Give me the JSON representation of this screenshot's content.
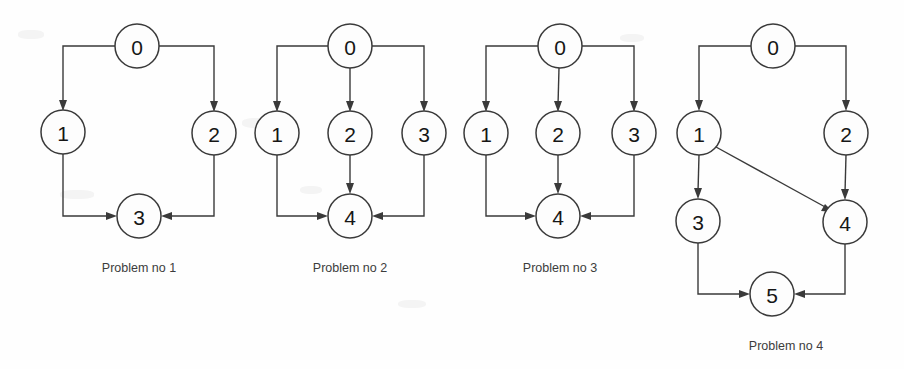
{
  "figure": {
    "width": 904,
    "height": 369,
    "background_color": "#fefefe",
    "stroke_color": "#3a3a3a",
    "label_color": "#161616",
    "caption_color": "#3c3c3c",
    "node_radius": 22
  },
  "diagrams": [
    {
      "id": "problem-1",
      "caption": "Problem no 1",
      "caption_x": 139,
      "caption_y": 272,
      "nodes": [
        {
          "label": "0",
          "x": 137,
          "y": 46
        },
        {
          "label": "1",
          "x": 63,
          "y": 132
        },
        {
          "label": "2",
          "x": 214,
          "y": 133
        },
        {
          "label": "3",
          "x": 139,
          "y": 216
        }
      ],
      "edges": [
        {
          "from": "0",
          "to": "1",
          "shape": "elbow-left-down"
        },
        {
          "from": "0",
          "to": "2",
          "shape": "elbow-right-down"
        },
        {
          "from": "1",
          "to": "3",
          "shape": "elbow-down-right"
        },
        {
          "from": "2",
          "to": "3",
          "shape": "elbow-down-left"
        }
      ]
    },
    {
      "id": "problem-2",
      "caption": "Problem no 2",
      "caption_x": 350,
      "caption_y": 272,
      "nodes": [
        {
          "label": "0",
          "x": 350,
          "y": 46
        },
        {
          "label": "1",
          "x": 277,
          "y": 133
        },
        {
          "label": "2",
          "x": 350,
          "y": 133
        },
        {
          "label": "3",
          "x": 424,
          "y": 133
        },
        {
          "label": "4",
          "x": 350,
          "y": 216
        }
      ],
      "edges": [
        {
          "from": "0",
          "to": "1",
          "shape": "elbow-left-down"
        },
        {
          "from": "0",
          "to": "2",
          "shape": "straight-down"
        },
        {
          "from": "0",
          "to": "3",
          "shape": "elbow-right-down"
        },
        {
          "from": "1",
          "to": "4",
          "shape": "elbow-down-right"
        },
        {
          "from": "2",
          "to": "4",
          "shape": "straight-down"
        },
        {
          "from": "3",
          "to": "4",
          "shape": "elbow-down-left"
        }
      ]
    },
    {
      "id": "problem-3",
      "caption": "Problem no 3",
      "caption_x": 560,
      "caption_y": 272,
      "nodes": [
        {
          "label": "0",
          "x": 560,
          "y": 46
        },
        {
          "label": "1",
          "x": 486,
          "y": 133
        },
        {
          "label": "2",
          "x": 558,
          "y": 133
        },
        {
          "label": "3",
          "x": 634,
          "y": 133
        },
        {
          "label": "4",
          "x": 558,
          "y": 216
        }
      ],
      "edges": [
        {
          "from": "0",
          "to": "1",
          "shape": "elbow-left-down"
        },
        {
          "from": "0",
          "to": "2",
          "shape": "straight-down"
        },
        {
          "from": "0",
          "to": "3",
          "shape": "elbow-right-down"
        },
        {
          "from": "1",
          "to": "4",
          "shape": "elbow-down-right"
        },
        {
          "from": "2",
          "to": "4",
          "shape": "straight-down"
        },
        {
          "from": "3",
          "to": "4",
          "shape": "elbow-down-left"
        }
      ]
    },
    {
      "id": "problem-4",
      "caption": "Problem no 4",
      "caption_x": 786,
      "caption_y": 350,
      "nodes": [
        {
          "label": "0",
          "x": 773,
          "y": 46
        },
        {
          "label": "1",
          "x": 699,
          "y": 133
        },
        {
          "label": "2",
          "x": 846,
          "y": 133
        },
        {
          "label": "3",
          "x": 698,
          "y": 221
        },
        {
          "label": "4",
          "x": 845,
          "y": 222
        },
        {
          "label": "5",
          "x": 772,
          "y": 294
        }
      ],
      "edges": [
        {
          "from": "0",
          "to": "1",
          "shape": "elbow-left-down"
        },
        {
          "from": "0",
          "to": "2",
          "shape": "elbow-right-down"
        },
        {
          "from": "1",
          "to": "3",
          "shape": "straight-down"
        },
        {
          "from": "1",
          "to": "4",
          "shape": "diagonal"
        },
        {
          "from": "2",
          "to": "4",
          "shape": "straight-down"
        },
        {
          "from": "3",
          "to": "5",
          "shape": "elbow-down-right"
        },
        {
          "from": "4",
          "to": "5",
          "shape": "elbow-down-left"
        }
      ]
    }
  ]
}
